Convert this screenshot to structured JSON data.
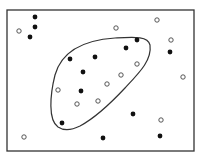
{
  "diagram": {
    "type": "set-region-scatter",
    "frame": {
      "x": 7,
      "y": 10,
      "width": 187,
      "height": 141,
      "stroke": "#333333"
    },
    "region": {
      "path": "M 58 127 C 48 120, 50 95, 55 75 C 62 50, 85 40, 115 38 C 135 37, 148 36, 150 45 C 152 60, 140 72, 125 88 C 110 104, 95 118, 80 126 C 72 130, 64 131, 58 127 Z",
      "stroke": "#333333"
    },
    "filled_points": [
      {
        "x": 35,
        "y": 17
      },
      {
        "x": 35,
        "y": 27
      },
      {
        "x": 30,
        "y": 37
      },
      {
        "x": 70,
        "y": 59
      },
      {
        "x": 95,
        "y": 57
      },
      {
        "x": 83,
        "y": 72
      },
      {
        "x": 137,
        "y": 40
      },
      {
        "x": 126,
        "y": 48
      },
      {
        "x": 170,
        "y": 52
      },
      {
        "x": 81,
        "y": 91
      },
      {
        "x": 62,
        "y": 123
      },
      {
        "x": 133,
        "y": 114
      },
      {
        "x": 103,
        "y": 138
      },
      {
        "x": 160,
        "y": 136
      }
    ],
    "open_points": [
      {
        "x": 19,
        "y": 31
      },
      {
        "x": 116,
        "y": 28
      },
      {
        "x": 157,
        "y": 20
      },
      {
        "x": 171,
        "y": 40
      },
      {
        "x": 137,
        "y": 64
      },
      {
        "x": 121,
        "y": 75
      },
      {
        "x": 107,
        "y": 84
      },
      {
        "x": 58,
        "y": 90
      },
      {
        "x": 77,
        "y": 104
      },
      {
        "x": 98,
        "y": 101
      },
      {
        "x": 183,
        "y": 77
      },
      {
        "x": 24,
        "y": 137
      },
      {
        "x": 161,
        "y": 120
      }
    ],
    "colors": {
      "filled": "#111111",
      "open_stroke": "#444444",
      "open_fill": "#ffffff"
    }
  }
}
